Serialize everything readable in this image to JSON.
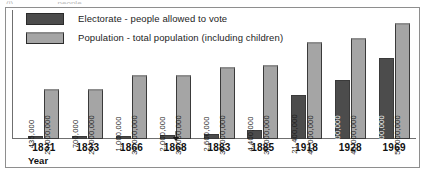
{
  "top_clip_text": "(i) .................. people .......................",
  "legend": {
    "position": "top-left",
    "entries": [
      {
        "swatch": "dark",
        "label": "Electorate - people allowed to vote"
      },
      {
        "swatch": "light",
        "label": "Population - total population (including children)"
      }
    ]
  },
  "axis": {
    "xlabel": "Year"
  },
  "colors": {
    "electorate": "#4c4c4c",
    "population": "#a5a5a5",
    "frame": "#8e8e8e",
    "axis": "#6f6f6f"
  },
  "chart_data": {
    "type": "bar",
    "title": "",
    "xlabel": "Year",
    "ylabel": "",
    "grid": false,
    "legend_position": "top-left",
    "ylim": [
      0,
      62000000
    ],
    "categories": [
      "1831",
      "1833",
      "1866",
      "1868",
      "1883",
      "1885",
      "1918",
      "1928",
      "1969"
    ],
    "series": [
      {
        "name": "Electorate - people allowed to vote",
        "color": "#4c4c4c",
        "values": [
          435000,
          700000,
          1000000,
          2000000,
          2600000,
          4400000,
          21400000,
          28800000,
          39000000
        ],
        "labels": [
          "435,000",
          "700,000",
          "1,000,000",
          "2,000,000",
          "2,600,000",
          "4,400,000",
          "21,400,000",
          "28,800,000",
          "39,000,000"
        ]
      },
      {
        "name": "Population - total population (including children)",
        "color": "#a5a5a5",
        "values": [
          24000000,
          24000000,
          31000000,
          31000000,
          35000000,
          36000000,
          47000000,
          49000000,
          56000000
        ],
        "labels": [
          "24,000,000",
          "24,000,000",
          "31,000,000",
          "31,000,000",
          "35,000,000",
          "36,000,000",
          "47,000,000",
          "49,000,000",
          "56,000,000"
        ]
      }
    ]
  }
}
